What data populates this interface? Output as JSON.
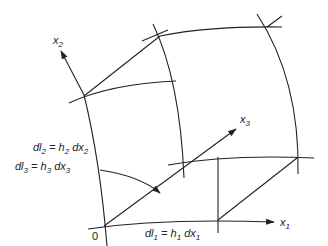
{
  "diagram": {
    "axes": {
      "x1": {
        "label": "x",
        "sub": "1"
      },
      "x2": {
        "label": "x",
        "sub": "2"
      },
      "x3": {
        "label": "x",
        "sub": "3"
      }
    },
    "origin_label": "0",
    "equations": {
      "dl1": {
        "lhs": "dl",
        "lhs_sub": "1",
        "eq": " = h",
        "h_sub": "1",
        "dx": " dx",
        "dx_sub": "1"
      },
      "dl2": {
        "lhs": "dl",
        "lhs_sub": "2",
        "eq": " = h",
        "h_sub": "2",
        "dx": " dx",
        "dx_sub": "2"
      },
      "dl3": {
        "lhs": "dl",
        "lhs_sub": "3",
        "eq": " = h",
        "h_sub": "3",
        "dx": " dx",
        "dx_sub": "3"
      }
    },
    "colors": {
      "stroke": "#222222",
      "background": "#ffffff"
    }
  }
}
